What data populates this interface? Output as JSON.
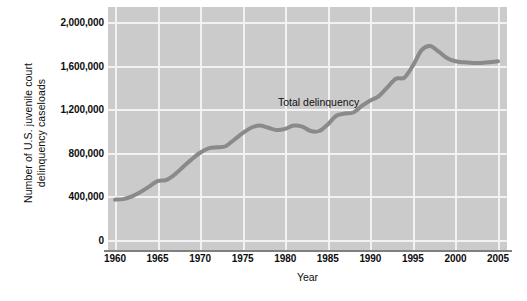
{
  "chart_data": {
    "type": "line",
    "title": "",
    "xlabel": "Year",
    "ylabel": "Number of U.S. juvenile court\ndelinquency caseloads",
    "xlim": [
      1960,
      2005
    ],
    "ylim": [
      0,
      2000000
    ],
    "xticks": [
      1960,
      1965,
      1970,
      1975,
      1980,
      1985,
      1990,
      1995,
      2000,
      2005
    ],
    "xtick_labels": [
      "1960",
      "1965",
      "1970",
      "1975",
      "1980",
      "1985",
      "1990",
      "1995",
      "2000",
      "2005"
    ],
    "yticks": [
      0,
      400000,
      800000,
      1200000,
      1600000,
      2000000
    ],
    "ytick_labels": [
      "0",
      "400,000",
      "800,000",
      "1,200,000",
      "1,600,000",
      "2,000,000"
    ],
    "grid": true,
    "grid_color": "#f2f2f2",
    "plot_background": "#cbcbcb",
    "line_color": "#8a8a8a",
    "line_width": 4,
    "legend_position": "inline-annotation",
    "series": [
      {
        "name": "Total delinquency",
        "annotation_label": "Total delinquency",
        "x": [
          1960,
          1961,
          1962,
          1963,
          1964,
          1965,
          1966,
          1967,
          1968,
          1969,
          1970,
          1971,
          1972,
          1973,
          1974,
          1975,
          1976,
          1977,
          1978,
          1979,
          1980,
          1981,
          1982,
          1983,
          1984,
          1985,
          1986,
          1987,
          1988,
          1989,
          1990,
          1991,
          1992,
          1993,
          1994,
          1995,
          1996,
          1997,
          1998,
          1999,
          2000,
          2001,
          2002,
          2003,
          2004,
          2005
        ],
        "values": [
          370000,
          375000,
          400000,
          440000,
          490000,
          540000,
          550000,
          600000,
          670000,
          740000,
          800000,
          840000,
          850000,
          860000,
          920000,
          980000,
          1030000,
          1050000,
          1030000,
          1010000,
          1020000,
          1050000,
          1040000,
          1000000,
          1000000,
          1060000,
          1140000,
          1160000,
          1170000,
          1230000,
          1280000,
          1320000,
          1400000,
          1480000,
          1490000,
          1600000,
          1740000,
          1780000,
          1730000,
          1670000,
          1640000,
          1630000,
          1625000,
          1625000,
          1630000,
          1640000
        ]
      }
    ]
  }
}
